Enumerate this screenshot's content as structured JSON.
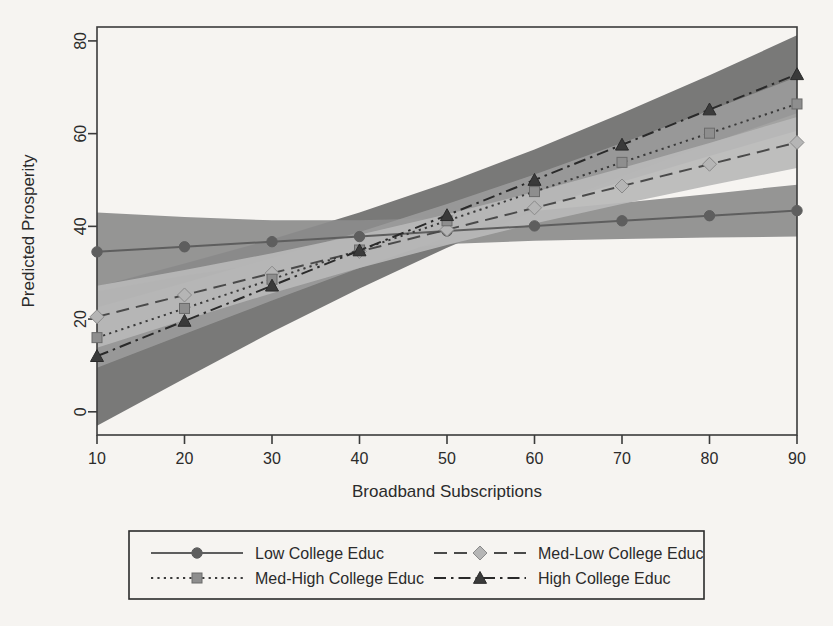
{
  "chart_data": {
    "type": "line",
    "title": "",
    "xlabel": "Broadband Subscriptions",
    "ylabel": "Predicted Prosperity",
    "xlim": [
      10,
      90
    ],
    "ylim": [
      -5,
      83
    ],
    "xticks": [
      10,
      20,
      30,
      40,
      50,
      60,
      70,
      80,
      90
    ],
    "yticks": [
      0,
      20,
      40,
      60,
      80
    ],
    "xtick_labels": [
      "10",
      "20",
      "30",
      "40",
      "50",
      "60",
      "70",
      "80",
      "90"
    ],
    "ytick_labels": [
      "0",
      "20",
      "40",
      "60",
      "80"
    ],
    "grid": false,
    "legend_position": "bottom",
    "x": [
      10,
      20,
      30,
      40,
      50,
      60,
      70,
      80,
      90
    ],
    "series": [
      {
        "name": "Low College Educ",
        "values": [
          34.5,
          35.6,
          36.7,
          37.8,
          39.0,
          40.1,
          41.2,
          42.3,
          43.4
        ],
        "ci_lower": [
          26.0,
          29.4,
          32.2,
          34.4,
          36.2,
          36.9,
          37.3,
          37.6,
          37.8
        ],
        "ci_upper": [
          43.0,
          42.0,
          41.3,
          41.3,
          41.8,
          43.3,
          45.1,
          47.0,
          49.0
        ],
        "line_style": "solid",
        "marker": "circle",
        "color": "#5e5e5e",
        "band_color": "#8c8c8c"
      },
      {
        "name": "Med-Low College Educ",
        "values": [
          20.5,
          25.2,
          29.9,
          34.6,
          39.3,
          44.0,
          48.7,
          53.4,
          58.1
        ],
        "ci_lower": [
          13.8,
          19.8,
          25.6,
          31.0,
          36.0,
          40.6,
          44.8,
          48.8,
          52.6
        ],
        "ci_upper": [
          27.2,
          30.6,
          34.2,
          38.2,
          42.6,
          47.4,
          52.6,
          58.0,
          63.6
        ],
        "line_style": "dashed",
        "marker": "diamond",
        "color": "#4a4a4a",
        "band_color": "#b8b8b8"
      },
      {
        "name": "Med-High College Educ",
        "values": [
          16.0,
          22.3,
          28.6,
          34.9,
          41.2,
          47.5,
          53.8,
          60.1,
          66.4
        ],
        "ci_lower": [
          9.5,
          16.8,
          24.0,
          31.0,
          37.6,
          43.8,
          49.6,
          55.2,
          60.6
        ],
        "ci_upper": [
          22.5,
          27.8,
          33.2,
          38.8,
          44.8,
          51.2,
          58.0,
          65.0,
          72.2
        ],
        "line_style": "dotted",
        "marker": "square",
        "color": "#3a3a3a",
        "band_color": "#9b9b9b"
      },
      {
        "name": "High College Educ",
        "values": [
          12.0,
          19.6,
          27.2,
          34.8,
          42.4,
          50.0,
          57.6,
          65.2,
          72.8
        ],
        "ci_lower": [
          -3.0,
          7.2,
          17.2,
          26.6,
          35.4,
          43.4,
          50.8,
          57.8,
          64.4
        ],
        "ci_upper": [
          27.0,
          32.0,
          37.2,
          43.0,
          49.4,
          56.6,
          64.4,
          72.6,
          81.2
        ],
        "line_style": "dashdot",
        "marker": "triangle",
        "color": "#2a2a2a",
        "band_color": "#6e6e6e"
      }
    ]
  },
  "legend": {
    "entries": [
      {
        "label": "Low College Educ",
        "line_style": "solid",
        "marker": "circle"
      },
      {
        "label": "Med-Low College Educ",
        "line_style": "dashed",
        "marker": "diamond"
      },
      {
        "label": "Med-High College Educ",
        "line_style": "dotted",
        "marker": "square"
      },
      {
        "label": "High College Educ",
        "line_style": "dashdot",
        "marker": "triangle"
      }
    ]
  },
  "colors": {
    "background": "#f6f4f1",
    "axis": "#3b3b3b",
    "text": "#2b2b2b"
  }
}
